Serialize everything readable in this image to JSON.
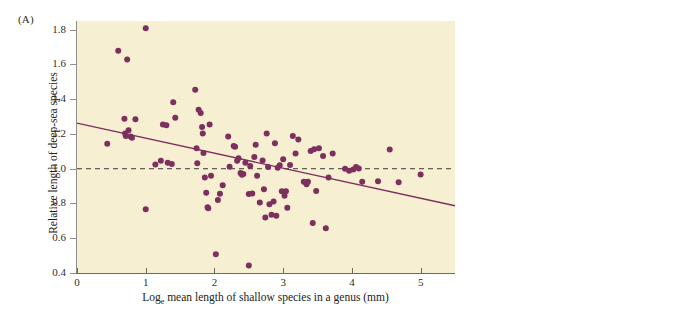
{
  "figure": {
    "panel_a_label": "(A)",
    "panel_b_label": "(B)"
  },
  "chart_data": {
    "type": "scatter",
    "title": "",
    "xlabel": "Log_e mean length of shallow species in a genus (mm)",
    "xlabel_prefix": "Log",
    "xlabel_sub": "e",
    "xlabel_rest": " mean length of shallow species in a genus (mm)",
    "ylabel": "Relative length of deep-sea species",
    "xlim": [
      0,
      5.5
    ],
    "ylim": [
      0.4,
      1.85
    ],
    "xticks": [
      0,
      1,
      2,
      3,
      4,
      5
    ],
    "xtick_labels": [
      "0",
      "1",
      "2",
      "3",
      "4",
      "5"
    ],
    "yticks": [
      0.4,
      0.6,
      0.8,
      1.0,
      1.2,
      1.4,
      1.6,
      1.8
    ],
    "ytick_labels": [
      "0.4",
      "0.6",
      "0.8",
      "1.0",
      "1.2",
      "1.4",
      "1.6",
      "1.8"
    ],
    "grid": false,
    "legend": "none",
    "point_color": "#7d2f5e",
    "point_radius": 3.0,
    "plot_background": "#f7efd2",
    "regression_line": {
      "color": "#7d2f5e",
      "style": "solid",
      "x_start": 0.0,
      "y_start": 1.262,
      "x_end": 5.5,
      "y_end": 0.787,
      "slope": -0.0864,
      "intercept": 1.262
    },
    "reference_line": {
      "color": "#3a3a3a",
      "style": "dashed",
      "y": 1.0,
      "label": "y = 1.0"
    },
    "points": [
      [
        0.44,
        1.143
      ],
      [
        0.6,
        1.679
      ],
      [
        0.69,
        1.288
      ],
      [
        0.7,
        1.203
      ],
      [
        0.71,
        1.189
      ],
      [
        0.73,
        1.628
      ],
      [
        0.75,
        1.222
      ],
      [
        0.78,
        1.186
      ],
      [
        0.8,
        1.178
      ],
      [
        0.85,
        1.285
      ],
      [
        1.0,
        1.808
      ],
      [
        1.0,
        0.767
      ],
      [
        1.14,
        1.024
      ],
      [
        1.22,
        1.046
      ],
      [
        1.25,
        1.254
      ],
      [
        1.3,
        1.25
      ],
      [
        1.32,
        1.035
      ],
      [
        1.38,
        1.027
      ],
      [
        1.4,
        1.382
      ],
      [
        1.43,
        1.293
      ],
      [
        1.72,
        1.455
      ],
      [
        1.74,
        1.118
      ],
      [
        1.75,
        1.031
      ],
      [
        1.77,
        1.34
      ],
      [
        1.8,
        1.321
      ],
      [
        1.82,
        1.24
      ],
      [
        1.83,
        1.203
      ],
      [
        1.84,
        1.09
      ],
      [
        1.86,
        0.95
      ],
      [
        1.88,
        0.862
      ],
      [
        1.9,
        0.778
      ],
      [
        1.91,
        0.772
      ],
      [
        1.93,
        1.254
      ],
      [
        1.95,
        0.96
      ],
      [
        2.02,
        0.508
      ],
      [
        2.05,
        0.82
      ],
      [
        2.08,
        0.856
      ],
      [
        2.12,
        0.905
      ],
      [
        2.2,
        1.186
      ],
      [
        2.22,
        1.012
      ],
      [
        2.28,
        1.131
      ],
      [
        2.3,
        1.126
      ],
      [
        2.33,
        1.046
      ],
      [
        2.35,
        1.06
      ],
      [
        2.38,
        0.975
      ],
      [
        2.4,
        0.965
      ],
      [
        2.42,
        0.97
      ],
      [
        2.45,
        1.035
      ],
      [
        2.5,
        0.443
      ],
      [
        2.5,
        0.855
      ],
      [
        2.52,
        1.015
      ],
      [
        2.55,
        0.857
      ],
      [
        2.58,
        1.068
      ],
      [
        2.6,
        1.138
      ],
      [
        2.62,
        0.96
      ],
      [
        2.66,
        0.805
      ],
      [
        2.7,
        1.047
      ],
      [
        2.72,
        0.882
      ],
      [
        2.74,
        0.72
      ],
      [
        2.76,
        1.203
      ],
      [
        2.78,
        1.01
      ],
      [
        2.8,
        0.796
      ],
      [
        2.83,
        0.735
      ],
      [
        2.86,
        0.812
      ],
      [
        2.88,
        1.147
      ],
      [
        2.9,
        0.73
      ],
      [
        2.92,
        1.005
      ],
      [
        2.95,
        1.02
      ],
      [
        2.98,
        0.87
      ],
      [
        3.0,
        1.055
      ],
      [
        3.02,
        0.845
      ],
      [
        3.04,
        0.87
      ],
      [
        3.06,
        0.776
      ],
      [
        3.1,
        1.022
      ],
      [
        3.14,
        1.188
      ],
      [
        3.18,
        1.088
      ],
      [
        3.22,
        1.168
      ],
      [
        3.3,
        0.925
      ],
      [
        3.34,
        0.91
      ],
      [
        3.36,
        0.925
      ],
      [
        3.4,
        1.102
      ],
      [
        3.43,
        0.688
      ],
      [
        3.45,
        1.112
      ],
      [
        3.48,
        0.872
      ],
      [
        3.52,
        1.118
      ],
      [
        3.58,
        1.073
      ],
      [
        3.62,
        0.658
      ],
      [
        3.66,
        0.95
      ],
      [
        3.72,
        1.088
      ],
      [
        3.9,
        1.0
      ],
      [
        3.96,
        0.988
      ],
      [
        4.02,
        0.995
      ],
      [
        4.06,
        1.01
      ],
      [
        4.1,
        1.002
      ],
      [
        4.15,
        0.925
      ],
      [
        4.38,
        0.928
      ],
      [
        4.55,
        1.11
      ],
      [
        4.68,
        0.922
      ],
      [
        5.0,
        0.967
      ]
    ]
  },
  "photo": {
    "description": "Photograph of three gastropod shells with a wooden ruler on black background",
    "background_color": "#0a0a0a",
    "ruler": {
      "inch_labels": [
        "12",
        "11",
        "10",
        "9",
        "8",
        "7",
        "6"
      ],
      "cm_labels": [
        "1",
        "2",
        "3",
        "4",
        "5",
        "6",
        "7",
        "8",
        "9",
        "10",
        "11",
        "12",
        "13",
        "14",
        "15"
      ]
    },
    "shells": [
      {
        "name": "large-ribbed-shell"
      },
      {
        "name": "small-spired-shell"
      },
      {
        "name": "cone-shell"
      },
      {
        "name": "tiny-shells"
      }
    ]
  }
}
